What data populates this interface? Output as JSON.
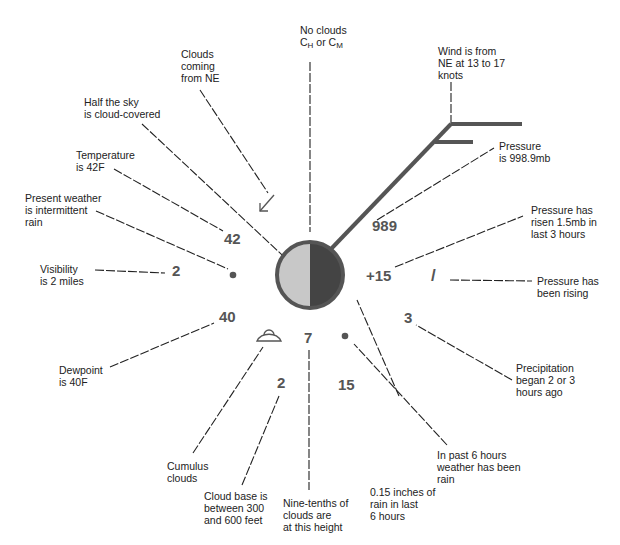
{
  "colors": {
    "station_outline": "#555555",
    "cloud_light": "#c8c8c8",
    "cloud_dark": "#444444",
    "wind_barb": "#555555",
    "values": "#555555",
    "text": "#222222"
  },
  "station_model": {
    "temperature": "42",
    "dewpoint": "40",
    "visibility": "2",
    "pressure": "989",
    "pressure_change": "+15",
    "pressure_tendency_symbol": "/",
    "precip_time": "3",
    "precip_amount": "15",
    "low_cloud_amount": "7",
    "cloud_base": "2",
    "sky_cover": "half",
    "cloud_motion_from": "NE",
    "wind_from": "NE",
    "wind_speed": "13-17 knots"
  },
  "annotations": {
    "no_clouds": {
      "line1": "No clouds",
      "ch": "C",
      "ch_sub": "H",
      "mid": " or ",
      "cm": "C",
      "cm_sub": "M"
    },
    "clouds_motion": "Clouds\ncoming\nfrom NE",
    "wind": "Wind is from\nNE at 13 to 17\nknots",
    "sky_cover": "Half the sky\nis cloud-covered",
    "temperature": "Temperature\nis 42F",
    "pressure": "Pressure\nis 998.9mb",
    "present_weather": "Present weather\nis intermittent\nrain",
    "pressure_change": "Pressure has\nrisen 1.5mb in\nlast 3 hours",
    "visibility": "Visibility\nis 2 miles",
    "pressure_tendency": "Pressure has\nbeen rising",
    "dewpoint": "Dewpoint\nis 40F",
    "precip_time": "Precipitation\nbegan 2 or 3\nhours ago",
    "past_weather": "In past 6 hours\nweather has been\nrain",
    "cumulus": "Cumulus\nclouds",
    "cloud_base": "Cloud base is\nbetween 300\nand 600 feet",
    "cloud_amount": "Nine-tenths of\nclouds are\nat this height",
    "precip_amount": "0.15 inches of\nrain in last\n6 hours"
  }
}
